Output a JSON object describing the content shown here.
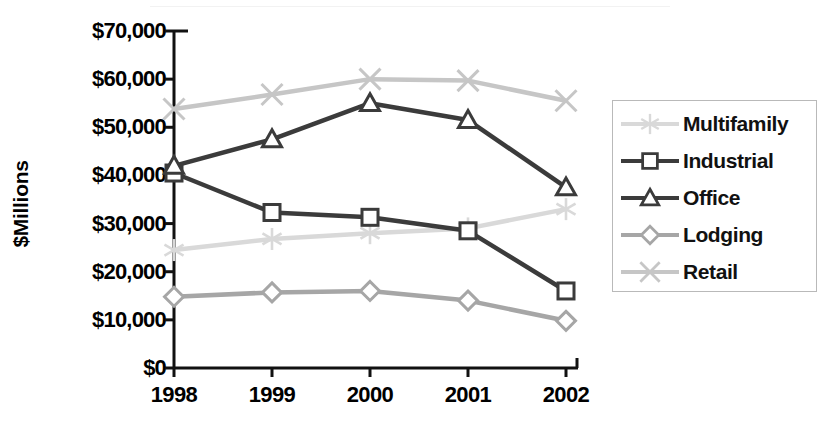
{
  "chart_data": {
    "type": "line",
    "title": "",
    "xlabel": "",
    "ylabel": "$Millions",
    "categories": [
      "1998",
      "1999",
      "2000",
      "2001",
      "2002"
    ],
    "ylim": [
      0,
      70000
    ],
    "ytick_values": [
      0,
      10000,
      20000,
      30000,
      40000,
      50000,
      60000,
      70000
    ],
    "ytick_labels": [
      "$0",
      "$10,000",
      "$20,000",
      "$30,000",
      "$40,000",
      "$50,000",
      "$60,000",
      "$70,000"
    ],
    "grid": false,
    "legend_position": "right",
    "series": [
      {
        "name": "Multifamily",
        "marker": "asterisk",
        "color": "#d9d9d9",
        "values": [
          24500,
          26800,
          28000,
          29000,
          33000
        ]
      },
      {
        "name": "Industrial",
        "marker": "square",
        "color": "#3b3b3b",
        "values": [
          40500,
          32300,
          31300,
          28500,
          16000
        ]
      },
      {
        "name": "Office",
        "marker": "triangle",
        "color": "#3b3b3b",
        "values": [
          42000,
          47500,
          55000,
          51500,
          37500
        ]
      },
      {
        "name": "Lodging",
        "marker": "diamond",
        "color": "#a6a6a6",
        "values": [
          14800,
          15700,
          16000,
          14000,
          9800
        ]
      },
      {
        "name": "Retail",
        "marker": "x",
        "color": "#c6c6c6",
        "values": [
          53800,
          56800,
          60000,
          59700,
          55500
        ]
      }
    ]
  },
  "legend": {
    "items": [
      {
        "label": "Multifamily"
      },
      {
        "label": "Industrial"
      },
      {
        "label": "Office"
      },
      {
        "label": "Lodging"
      },
      {
        "label": "Retail"
      }
    ]
  }
}
